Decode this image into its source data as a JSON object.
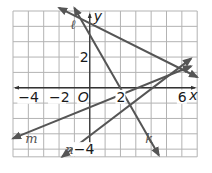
{
  "graph": {
    "axes": {
      "x_label": "x",
      "y_label": "y",
      "origin_label": "O",
      "x_ticks": [
        {
          "value": -4,
          "label": "−4"
        },
        {
          "value": -2,
          "label": "−2"
        },
        {
          "value": 2,
          "label": "2"
        },
        {
          "value": 6,
          "label": "6"
        }
      ],
      "y_ticks": [
        {
          "value": 2,
          "label": "2"
        },
        {
          "value": -4,
          "label": "−4"
        }
      ],
      "x_range": [
        -5,
        7
      ],
      "y_range": [
        -4.5,
        5
      ]
    },
    "lines": [
      {
        "name": "ℓ",
        "id": "l",
        "p1": [
          -2,
          5.2
        ],
        "p2": [
          7,
          0.7
        ]
      },
      {
        "name": "k",
        "id": "k",
        "p1": [
          -1,
          5.2
        ],
        "p2": [
          4.5,
          -4.4
        ]
      },
      {
        "name": "m",
        "id": "m",
        "p1": [
          -5,
          -3.3
        ],
        "p2": [
          6.6,
          1.4
        ]
      },
      {
        "name": "n",
        "id": "n",
        "p1": [
          -1.8,
          -4.5
        ],
        "p2": [
          6.6,
          1.9
        ]
      }
    ],
    "colors": {
      "grid": "#b3b3b3",
      "axis": "#333333",
      "line": "#555555"
    }
  }
}
